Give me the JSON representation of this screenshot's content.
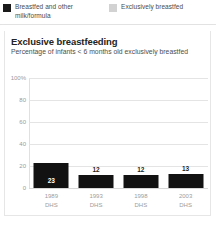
{
  "legend": {
    "items": [
      {
        "label": "Breastfed and other milk/formula",
        "color": "#1a1a1a",
        "swatch": "dark"
      },
      {
        "label": "Exclusively breastfed",
        "color": "#d2d2d2",
        "swatch": "light"
      }
    ]
  },
  "card": {
    "title": "Exclusive breastfeeding",
    "subtitle": "Percentage of infants < 6 months old exclusively breastfed"
  },
  "chart_data": {
    "type": "bar",
    "title": "Exclusive breastfeeding",
    "subtitle": "Percentage of infants < 6 months old exclusively breastfed",
    "categories": [
      "1989 DHS",
      "1993 DHS",
      "1998 DHS",
      "2003 DHS"
    ],
    "category_years": [
      "1989",
      "1993",
      "1998",
      "2003"
    ],
    "category_sources": [
      "DHS",
      "DHS",
      "DHS",
      "DHS"
    ],
    "values": [
      23,
      12,
      12,
      13
    ],
    "value_labels": [
      "23",
      "12",
      "12",
      "13"
    ],
    "label_placement": [
      "inside",
      "above",
      "above",
      "above"
    ],
    "series_name": "Exclusively breastfed",
    "bar_color": "#121212",
    "xlabel": "",
    "ylabel": "",
    "ylim": [
      0,
      100
    ],
    "yticks": [
      0,
      20,
      40,
      60,
      80,
      100
    ],
    "ytick_labels": [
      "0",
      "20",
      "40",
      "60",
      "80",
      "100%"
    ],
    "grid": true,
    "legend_position": "top"
  }
}
